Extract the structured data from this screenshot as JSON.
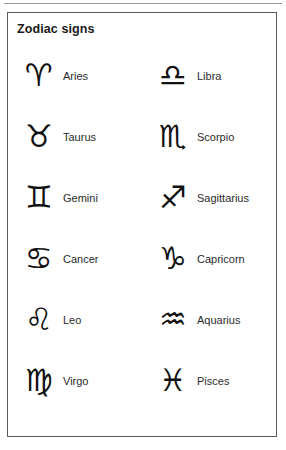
{
  "panel": {
    "title": "Zodiac signs",
    "border_color": "#5a5a5a",
    "background_color": "#ffffff",
    "top_rule_color": "#9a9a9a",
    "text_color": "#2b2b2b"
  },
  "columns": [
    {
      "name": "left",
      "signs": [
        {
          "symbol": "♈",
          "label": "Aries",
          "icon": "aries-symbol"
        },
        {
          "symbol": "♉",
          "label": "Taurus",
          "icon": "taurus-symbol"
        },
        {
          "symbol": "♊",
          "label": "Gemini",
          "icon": "gemini-symbol"
        },
        {
          "symbol": "♋",
          "label": "Cancer",
          "icon": "cancer-symbol"
        },
        {
          "symbol": "♌",
          "label": "Leo",
          "icon": "leo-symbol"
        },
        {
          "symbol": "♍",
          "label": "Virgo",
          "icon": "virgo-symbol"
        }
      ]
    },
    {
      "name": "right",
      "signs": [
        {
          "symbol": "♎",
          "label": "Libra",
          "icon": "libra-symbol"
        },
        {
          "symbol": "♏",
          "label": "Scorpio",
          "icon": "scorpio-symbol"
        },
        {
          "symbol": "♐",
          "label": "Sagittarius",
          "icon": "sagittarius-symbol"
        },
        {
          "symbol": "♑",
          "label": "Capricorn",
          "icon": "capricorn-symbol"
        },
        {
          "symbol": "♒",
          "label": "Aquarius",
          "icon": "aquarius-symbol"
        },
        {
          "symbol": "♓",
          "label": "Pisces",
          "icon": "pisces-symbol"
        }
      ]
    }
  ]
}
